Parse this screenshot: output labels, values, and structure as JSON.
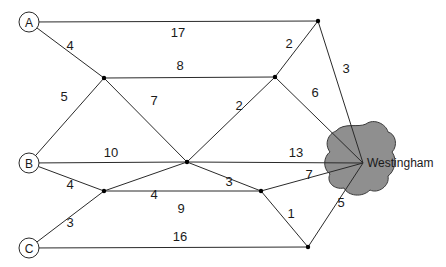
{
  "diagram": {
    "title": "",
    "destination": "Westingham",
    "sources": [
      "A",
      "B",
      "C"
    ],
    "nodes": [
      {
        "id": "A",
        "label": "A",
        "type": "source"
      },
      {
        "id": "B",
        "label": "B",
        "type": "source"
      },
      {
        "id": "C",
        "label": "C",
        "type": "source"
      },
      {
        "id": "J1",
        "label": "",
        "type": "junction"
      },
      {
        "id": "J2",
        "label": "",
        "type": "junction"
      },
      {
        "id": "J3",
        "label": "",
        "type": "junction"
      },
      {
        "id": "J4",
        "label": "",
        "type": "junction"
      },
      {
        "id": "J5",
        "label": "",
        "type": "junction"
      },
      {
        "id": "J6",
        "label": "",
        "type": "junction"
      },
      {
        "id": "J7",
        "label": "",
        "type": "junction"
      },
      {
        "id": "W",
        "label": "Westingham",
        "type": "city"
      }
    ],
    "edges": [
      {
        "from": "A",
        "to": "J1",
        "weight": "17"
      },
      {
        "from": "A",
        "to": "J2",
        "weight": "4"
      },
      {
        "from": "J2",
        "to": "J3",
        "weight": "8"
      },
      {
        "from": "B",
        "to": "J2",
        "weight": "5"
      },
      {
        "from": "J2",
        "to": "J4",
        "weight": "7"
      },
      {
        "from": "J3",
        "to": "J1",
        "weight": "2"
      },
      {
        "from": "J1",
        "to": "W",
        "weight": "3"
      },
      {
        "from": "J3",
        "to": "W",
        "weight": "6"
      },
      {
        "from": "J4",
        "to": "J3",
        "weight": "2"
      },
      {
        "from": "B",
        "to": "J4",
        "weight": "10"
      },
      {
        "from": "J4",
        "to": "W",
        "weight": "13"
      },
      {
        "from": "B",
        "to": "J5",
        "weight": "4"
      },
      {
        "from": "J5",
        "to": "J4",
        "weight": "4"
      },
      {
        "from": "J4",
        "to": "J6",
        "weight": "3"
      },
      {
        "from": "J5",
        "to": "J6",
        "weight": "9"
      },
      {
        "from": "J6",
        "to": "W",
        "weight": "7"
      },
      {
        "from": "C",
        "to": "J5",
        "weight": "3"
      },
      {
        "from": "J6",
        "to": "J7",
        "weight": "1"
      },
      {
        "from": "C",
        "to": "J7",
        "weight": "16"
      },
      {
        "from": "J7",
        "to": "W",
        "weight": "5"
      }
    ]
  }
}
